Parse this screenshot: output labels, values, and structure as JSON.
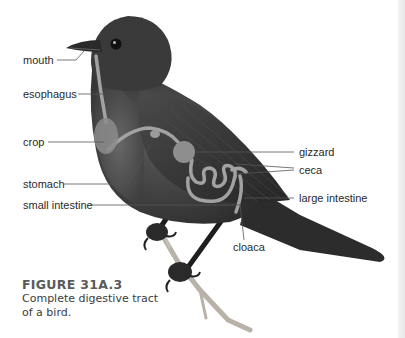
{
  "figure": {
    "number": "FIGURE 31A.3",
    "caption": "Complete digestive tract of a bird."
  },
  "labels": {
    "mouth": "mouth",
    "esophagus": "esophagus",
    "crop": "crop",
    "stomach": "stomach",
    "small_intestine": "small intestine",
    "gizzard": "gizzard",
    "ceca": "ceca",
    "large_intestine": "large intestine",
    "cloaca": "cloaca"
  },
  "colors": {
    "background": "#ffffff",
    "bird_body": "#3a3a3a",
    "digestive_tract": "#a8a8a8",
    "leader_lines": "#555555",
    "label_text": "#2a2a2a"
  }
}
